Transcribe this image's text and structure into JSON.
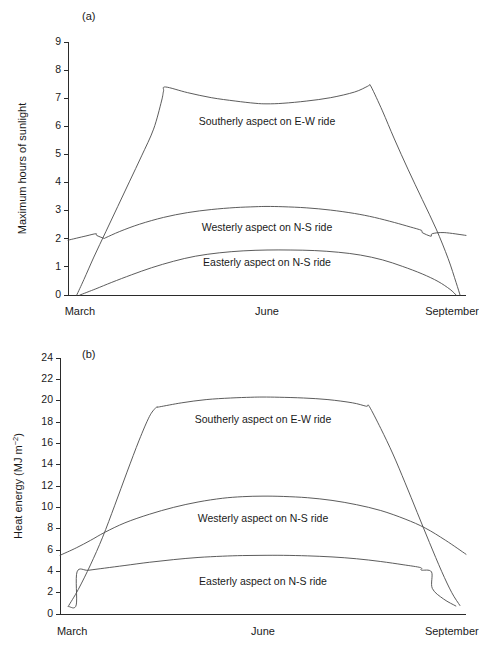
{
  "figure": {
    "name": "sunlight-heat-energy-figure",
    "background": "#ffffff",
    "line_color": "#4a4a4a",
    "axis_color": "#2b2b2b",
    "text_color": "#1a1a1a"
  },
  "panels": [
    {
      "id": "a",
      "label": "(a)",
      "ylabel": "Maximum hours of sunlight",
      "ylabel_unit": "",
      "ylabel_sup": "",
      "xticklabels": [
        "March",
        "June",
        "September"
      ],
      "yticklabels": [
        "0",
        "1",
        "2",
        "3",
        "4",
        "5",
        "6",
        "7",
        "8",
        "9"
      ],
      "annotations": [
        {
          "text": "Southerly aspect on E-W ride",
          "x_frac": 0.5,
          "y_value": 6.05
        },
        {
          "text": "Westerly aspect on N-S ride",
          "x_frac": 0.5,
          "y_value": 2.27
        },
        {
          "text": "Easterly aspect on N-S ride",
          "x_frac": 0.5,
          "y_value": 1.03
        }
      ]
    },
    {
      "id": "b",
      "label": "(b)",
      "ylabel": "Heat energy (MJ m",
      "ylabel_unit": ")",
      "ylabel_sup": "−2",
      "xticklabels": [
        "March",
        "June",
        "September"
      ],
      "yticklabels": [
        "0",
        "2",
        "4",
        "6",
        "8",
        "10",
        "12",
        "14",
        "16",
        "18",
        "20",
        "22",
        "24"
      ],
      "annotations": [
        {
          "text": "Southerly aspect on E-W ride",
          "x_frac": 0.5,
          "y_value": 17.95
        },
        {
          "text": "Westerly aspect on N-S ride",
          "x_frac": 0.5,
          "y_value": 8.65
        },
        {
          "text": "Easterly aspect on N-S ride",
          "x_frac": 0.5,
          "y_value": 2.75
        }
      ]
    }
  ],
  "chart_data": [
    {
      "type": "line",
      "panel": "a",
      "title": "(a)",
      "xlabel": "",
      "ylabel": "Maximum hours of sunlight",
      "xlim": [
        0,
        1
      ],
      "ylim": [
        0,
        9
      ],
      "yticks": [
        0,
        1,
        2,
        3,
        4,
        5,
        6,
        7,
        8,
        9
      ],
      "xticks": [
        0.03,
        0.5,
        0.965
      ],
      "xticklabels": [
        "March",
        "June",
        "September"
      ],
      "grid": false,
      "legend": "inline-annotations",
      "series": [
        {
          "name": "Southerly aspect on E-W ride",
          "x": [
            0.022,
            0.04,
            0.065,
            0.095,
            0.125,
            0.155,
            0.185,
            0.215,
            0.235,
            0.24,
            0.245,
            0.3,
            0.36,
            0.42,
            0.47,
            0.5,
            0.54,
            0.6,
            0.66,
            0.72,
            0.752,
            0.757,
            0.762,
            0.79,
            0.82,
            0.855,
            0.89,
            0.925,
            0.955,
            0.975,
            0.985
          ],
          "y": [
            0.0,
            0.55,
            1.35,
            2.25,
            3.15,
            4.05,
            4.95,
            5.9,
            6.9,
            7.25,
            7.4,
            7.2,
            7.02,
            6.9,
            6.82,
            6.8,
            6.82,
            6.9,
            7.02,
            7.22,
            7.42,
            7.46,
            7.4,
            6.55,
            5.55,
            4.45,
            3.4,
            2.35,
            1.3,
            0.45,
            0.0
          ]
        },
        {
          "name": "Westerly aspect on N-S ride",
          "x": [
            0.0,
            0.045,
            0.07,
            0.072,
            0.09,
            0.095,
            0.13,
            0.18,
            0.24,
            0.3,
            0.36,
            0.42,
            0.47,
            0.5,
            0.54,
            0.6,
            0.66,
            0.72,
            0.77,
            0.82,
            0.86,
            0.888,
            0.89,
            0.912,
            0.915,
            0.945,
            1.0
          ],
          "y": [
            1.95,
            2.1,
            2.18,
            2.12,
            2.02,
            2.04,
            2.26,
            2.52,
            2.76,
            2.93,
            3.04,
            3.11,
            3.14,
            3.15,
            3.14,
            3.1,
            3.02,
            2.9,
            2.76,
            2.58,
            2.42,
            2.3,
            2.22,
            2.09,
            2.18,
            2.22,
            2.12
          ]
        },
        {
          "name": "Easterly aspect on N-S ride",
          "x": [
            0.03,
            0.07,
            0.11,
            0.16,
            0.21,
            0.265,
            0.32,
            0.38,
            0.44,
            0.5,
            0.56,
            0.62,
            0.68,
            0.735,
            0.79,
            0.84,
            0.89,
            0.93,
            0.96,
            0.975
          ],
          "y": [
            0.0,
            0.22,
            0.45,
            0.72,
            0.97,
            1.2,
            1.38,
            1.5,
            1.57,
            1.6,
            1.6,
            1.58,
            1.52,
            1.42,
            1.25,
            1.02,
            0.75,
            0.48,
            0.2,
            0.0
          ]
        }
      ]
    },
    {
      "type": "line",
      "panel": "b",
      "title": "(b)",
      "xlabel": "",
      "ylabel": "Heat energy (MJ m-2)",
      "xlim": [
        0,
        1
      ],
      "ylim": [
        0,
        24
      ],
      "yticks": [
        0,
        2,
        4,
        6,
        8,
        10,
        12,
        14,
        16,
        18,
        20,
        22,
        24
      ],
      "xticks": [
        0.03,
        0.5,
        0.965
      ],
      "xticklabels": [
        "March",
        "June",
        "September"
      ],
      "grid": false,
      "legend": "inline-annotations",
      "series": [
        {
          "name": "Southerly aspect on E-W ride",
          "x": [
            0.02,
            0.045,
            0.075,
            0.105,
            0.135,
            0.165,
            0.195,
            0.22,
            0.235,
            0.24,
            0.245,
            0.3,
            0.36,
            0.42,
            0.47,
            0.5,
            0.54,
            0.6,
            0.66,
            0.72,
            0.752,
            0.757,
            0.762,
            0.79,
            0.82,
            0.85,
            0.88,
            0.91,
            0.94,
            0.965,
            0.985
          ],
          "y": [
            0.7,
            2.3,
            4.6,
            7.2,
            10.2,
            13.3,
            16.3,
            18.5,
            19.3,
            19.4,
            19.42,
            19.8,
            20.1,
            20.25,
            20.32,
            20.34,
            20.32,
            20.25,
            20.1,
            19.8,
            19.5,
            19.48,
            19.45,
            17.4,
            15.0,
            12.3,
            9.5,
            6.7,
            4.0,
            2.0,
            0.8
          ]
        },
        {
          "name": "Westerly aspect on N-S ride",
          "x": [
            0.0,
            0.04,
            0.075,
            0.11,
            0.16,
            0.22,
            0.28,
            0.34,
            0.4,
            0.45,
            0.5,
            0.55,
            0.61,
            0.67,
            0.73,
            0.79,
            0.85,
            0.9,
            0.95,
            1.0
          ],
          "y": [
            5.5,
            6.2,
            6.9,
            7.65,
            8.55,
            9.35,
            10.0,
            10.5,
            10.85,
            11.0,
            11.05,
            11.02,
            10.9,
            10.65,
            10.25,
            9.7,
            8.9,
            8.05,
            6.9,
            5.6
          ]
        },
        {
          "name": "Easterly aspect on N-S ride",
          "x": [
            0.022,
            0.04,
            0.042,
            0.07,
            0.11,
            0.16,
            0.22,
            0.28,
            0.34,
            0.4,
            0.45,
            0.5,
            0.55,
            0.61,
            0.67,
            0.73,
            0.79,
            0.845,
            0.888,
            0.89,
            0.915,
            0.917,
            0.945,
            0.975
          ],
          "y": [
            0.7,
            0.85,
            3.95,
            4.1,
            4.3,
            4.55,
            4.85,
            5.1,
            5.3,
            5.42,
            5.48,
            5.5,
            5.5,
            5.45,
            5.35,
            5.18,
            4.92,
            4.62,
            4.35,
            4.12,
            3.95,
            2.4,
            1.4,
            0.75
          ]
        }
      ]
    }
  ]
}
